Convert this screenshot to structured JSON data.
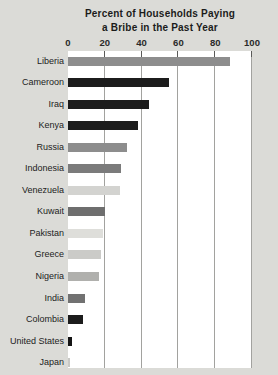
{
  "title": {
    "line1": "Percent of Households Paying",
    "line2": "a Bribe in the Past Year"
  },
  "chart_data": {
    "type": "bar",
    "orientation": "horizontal",
    "title": "Percent of Households Paying a Bribe in the Past Year",
    "xlabel": "",
    "ylabel": "",
    "xlim": [
      0,
      100
    ],
    "x_ticks": [
      0,
      20,
      40,
      60,
      80,
      100
    ],
    "grid": true,
    "legend": "none",
    "categories": [
      "Liberia",
      "Cameroon",
      "Iraq",
      "Kenya",
      "Russia",
      "Indonesia",
      "Venezuela",
      "Kuwait",
      "Pakistan",
      "Greece",
      "Nigeria",
      "India",
      "Colombia",
      "United States",
      "Japan"
    ],
    "values": [
      88,
      55,
      44,
      38,
      32,
      29,
      28,
      20,
      19,
      18,
      17,
      9,
      8,
      2,
      1
    ],
    "bar_colors": [
      "#8d8d8d",
      "#1c1c1c",
      "#1c1c1c",
      "#1c1c1c",
      "#8d8d8d",
      "#7b7b7b",
      "#d3d3d0",
      "#6e6e6e",
      "#dededa",
      "#cbcbc8",
      "#b0b0ad",
      "#717171",
      "#1c1c1c",
      "#141414",
      "#c9c9c6"
    ]
  },
  "colors": {
    "background": "#dbdbd7",
    "plot_background": "#ffffff",
    "gridline": "#a2a29f",
    "tick": "#5a5a58",
    "text": "#1b1b1b"
  }
}
